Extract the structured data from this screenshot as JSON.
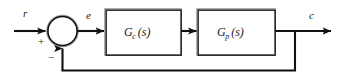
{
  "diagram": {
    "type": "control-system-block-diagram",
    "signals": {
      "reference_input": "r",
      "error": "e",
      "output": "c"
    },
    "summing_junction": {
      "name": "summing-junction",
      "plus_sign": "+",
      "minus_sign": "−",
      "plus_input": "r",
      "minus_input": "c"
    },
    "blocks": [
      {
        "id": "controller",
        "name": "controller-block",
        "symbol": "G",
        "subscript": "c",
        "argument": "(s)",
        "label": "G_c(s)"
      },
      {
        "id": "plant",
        "name": "plant-block",
        "symbol": "G",
        "subscript": "p",
        "argument": "(s)",
        "label": "G_p(s)"
      }
    ],
    "feedback": {
      "name": "feedback-path",
      "type": "unity",
      "sign": "negative"
    },
    "colors": {
      "line": "#111111",
      "box_border": "#1a1a1a",
      "box_shadow": "#9a9a9a",
      "background": "#ffffff",
      "text": "#1a1a1a"
    }
  }
}
